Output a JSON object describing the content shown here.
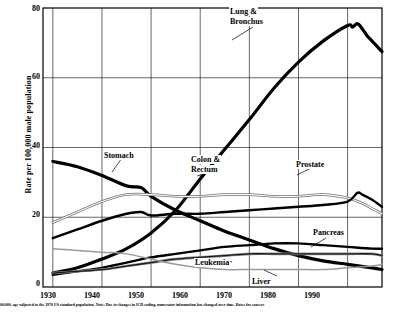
{
  "chart_data": {
    "type": "line",
    "title": "",
    "xlabel": "",
    "ylabel": "Rate per 100,000 male population",
    "xlim": [
      1928,
      1997
    ],
    "ylim": [
      0,
      80
    ],
    "yticks": [
      "0",
      "20",
      "40",
      "60",
      "80"
    ],
    "ytick_values": [
      0,
      20,
      40,
      60,
      80
    ],
    "xticks": [
      "1930",
      "1940",
      "1950",
      "1960",
      "1970",
      "1980",
      "1990"
    ],
    "xtick_values": [
      1930,
      1940,
      1950,
      1960,
      1970,
      1980,
      1990
    ],
    "grid": true,
    "legend": "annotations-on-plot",
    "series": [
      {
        "name": "Lung & Bronchus",
        "label": "Lung &\nBronchus",
        "style": "thick-black",
        "x": [
          1930,
          1935,
          1940,
          1945,
          1950,
          1955,
          1960,
          1965,
          1970,
          1975,
          1980,
          1985,
          1990,
          1991,
          1992,
          1993,
          1994,
          1995,
          1996,
          1997
        ],
        "values": [
          4,
          5.5,
          8,
          11,
          15.5,
          22,
          31,
          39.5,
          48,
          57,
          64.5,
          70.5,
          75,
          74.5,
          75.5,
          74,
          72,
          70.5,
          69,
          67.5
        ]
      },
      {
        "name": "Stomach",
        "label": "Stomach",
        "style": "thick-black",
        "x": [
          1930,
          1935,
          1940,
          1945,
          1948,
          1950,
          1955,
          1960,
          1965,
          1970,
          1975,
          1980,
          1985,
          1990,
          1995,
          1997
        ],
        "values": [
          36,
          34.5,
          32,
          29,
          28.5,
          26,
          22,
          19,
          16,
          13.5,
          11,
          9,
          7.5,
          6.5,
          5.5,
          5
        ]
      },
      {
        "name": "Colon & Rectum",
        "label": "Colon &\nRectum",
        "style": "thin-outline",
        "x": [
          1930,
          1935,
          1940,
          1945,
          1950,
          1955,
          1960,
          1965,
          1970,
          1975,
          1980,
          1985,
          1990,
          1993,
          1995,
          1997
        ],
        "values": [
          18.5,
          21.5,
          24.5,
          26.5,
          26.5,
          26,
          26,
          26.5,
          26.5,
          26,
          26,
          26.5,
          25.5,
          24,
          22.5,
          21
        ]
      },
      {
        "name": "Prostate",
        "label": "Prostate",
        "style": "medium-black",
        "x": [
          1930,
          1935,
          1940,
          1945,
          1948,
          1950,
          1955,
          1960,
          1965,
          1970,
          1975,
          1980,
          1985,
          1990,
          1992,
          1993,
          1995,
          1997
        ],
        "values": [
          14,
          16.5,
          19,
          21,
          21.5,
          20.5,
          21,
          21,
          21.5,
          22,
          22.5,
          23,
          23.5,
          24.5,
          27,
          26.5,
          25,
          23
        ]
      },
      {
        "name": "Pancreas",
        "label": "Pancreas",
        "style": "medium-black",
        "x": [
          1930,
          1935,
          1940,
          1945,
          1950,
          1955,
          1960,
          1965,
          1970,
          1975,
          1980,
          1985,
          1990,
          1995,
          1997
        ],
        "values": [
          3.5,
          4.5,
          5.5,
          7,
          8.5,
          9.5,
          10.5,
          11.5,
          12,
          12.5,
          12.5,
          12,
          11.5,
          11,
          11
        ]
      },
      {
        "name": "Leukemia",
        "label": "Leukemia",
        "style": "medium-gray",
        "x": [
          1930,
          1935,
          1940,
          1945,
          1950,
          1955,
          1960,
          1965,
          1970,
          1975,
          1980,
          1985,
          1990,
          1995,
          1997
        ],
        "values": [
          4,
          4.5,
          5,
          6,
          7,
          8,
          8.5,
          9,
          9.5,
          9.5,
          9.5,
          9.5,
          9.5,
          9.5,
          9
        ]
      },
      {
        "name": "Liver",
        "label": "Liver",
        "style": "thin-gray",
        "x": [
          1930,
          1935,
          1940,
          1945,
          1950,
          1955,
          1960,
          1965,
          1970,
          1975,
          1980,
          1985,
          1990,
          1995,
          1997
        ],
        "values": [
          11,
          10.5,
          10,
          9.5,
          8,
          6.5,
          5.5,
          5,
          5,
          5,
          5,
          5,
          5.5,
          6,
          6.5
        ]
      }
    ]
  },
  "annotations": {
    "lung": {
      "line1": "Lung &",
      "line2": "Bronchus"
    },
    "stomach": {
      "label": "Stomach"
    },
    "colon": {
      "line1": "Colon &",
      "line2": "Rectum"
    },
    "prostate": {
      "label": "Prostate"
    },
    "pancreas": {
      "label": "Pancreas"
    },
    "leukemia": {
      "label": "Leukemia"
    },
    "liver": {
      "label": "Liver"
    }
  },
  "axis": {
    "ylabel": "Rate per 100,000 male population",
    "y0": "0",
    "y20": "20",
    "y40": "40",
    "y60": "60",
    "y80": "80",
    "x1930": "1930",
    "x1940": "1940",
    "x1950": "1950",
    "x1960": "1960",
    "x1970": "1970",
    "x1980": "1980",
    "x1990": "1990"
  },
  "footnote": {
    "text": "00,000, age-adjusted to the 1970 US standard population.  Note: Due to changes in ICD coding, numerator information has changed over time.  Rates for cancers"
  }
}
